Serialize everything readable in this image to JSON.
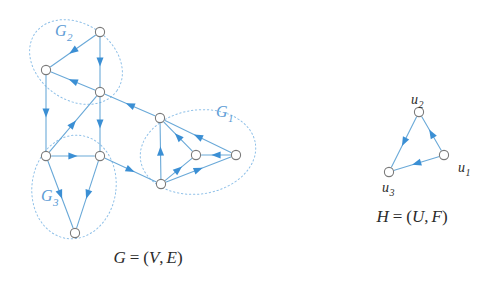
{
  "figure": {
    "background_color": "#ffffff",
    "edge_color": "#6aa9d8",
    "node_stroke_color": "#7a7a7a",
    "node_fill_color": "#ffffff",
    "cluster_outline_color": "#8fc0e8",
    "label_color_cluster": "#5b9bd5",
    "label_color_text": "#2b2b2b",
    "arrow_color": "#3b8fd4"
  },
  "graph_g": {
    "caption": "G = (V, E)",
    "caption_parts": {
      "name": "G",
      "equals": "=",
      "open": "(",
      "vertices": "V",
      "comma": ",",
      "edges": "E",
      "close": ")"
    },
    "clusters": [
      {
        "id": "G1",
        "label": "G",
        "subscript": "1",
        "label_x": 216,
        "label_y": 117,
        "cx": 198,
        "cy": 152,
        "rx": 58,
        "ry": 42,
        "rotation": -8
      },
      {
        "id": "G2",
        "label": "G",
        "subscript": "2",
        "label_x": 55,
        "label_y": 36,
        "cx": 76,
        "cy": 62,
        "rx": 50,
        "ry": 38,
        "rotation": 35
      },
      {
        "id": "G3",
        "label": "G",
        "subscript": "3",
        "label_x": 41,
        "label_y": 201,
        "cx": 74,
        "cy": 187,
        "rx": 42,
        "ry": 52,
        "rotation": 8
      }
    ],
    "nodes": [
      {
        "id": "v1",
        "x": 100,
        "y": 32,
        "cluster": "G2"
      },
      {
        "id": "v2",
        "x": 46,
        "y": 70,
        "cluster": "G2"
      },
      {
        "id": "v3",
        "x": 100,
        "y": 92,
        "cluster": "G2"
      },
      {
        "id": "v4",
        "x": 46,
        "y": 156,
        "cluster": "G3"
      },
      {
        "id": "v5",
        "x": 100,
        "y": 156,
        "cluster": "G3"
      },
      {
        "id": "v6",
        "x": 75,
        "y": 233,
        "cluster": "G3"
      },
      {
        "id": "v7",
        "x": 160,
        "y": 118,
        "cluster": "G1"
      },
      {
        "id": "v8",
        "x": 196,
        "y": 155,
        "cluster": "G1"
      },
      {
        "id": "v9",
        "x": 236,
        "y": 155,
        "cluster": "G1"
      },
      {
        "id": "v10",
        "x": 161,
        "y": 184,
        "cluster": "G1"
      }
    ],
    "edges": [
      {
        "from": "v1",
        "to": "v2"
      },
      {
        "from": "v1",
        "to": "v3"
      },
      {
        "from": "v2",
        "to": "v4"
      },
      {
        "from": "v3",
        "to": "v5"
      },
      {
        "from": "v3",
        "to": "v2"
      },
      {
        "from": "v4",
        "to": "v3"
      },
      {
        "from": "v4",
        "to": "v5"
      },
      {
        "from": "v4",
        "to": "v6"
      },
      {
        "from": "v5",
        "to": "v6"
      },
      {
        "from": "v5",
        "to": "v10"
      },
      {
        "from": "v7",
        "to": "v3"
      },
      {
        "from": "v10",
        "to": "v7"
      },
      {
        "from": "v8",
        "to": "v7"
      },
      {
        "from": "v9",
        "to": "v7"
      },
      {
        "from": "v9",
        "to": "v8"
      },
      {
        "from": "v10",
        "to": "v8"
      },
      {
        "from": "v10",
        "to": "v9"
      }
    ]
  },
  "graph_h": {
    "caption": "H = (U, F)",
    "caption_parts": {
      "name": "H",
      "equals": "=",
      "open": "(",
      "vertices": "U",
      "comma": ",",
      "edges": "F",
      "close": ")"
    },
    "nodes": [
      {
        "id": "u1",
        "label": "u",
        "subscript": "1",
        "x": 444,
        "y": 155,
        "label_x": 458,
        "label_y": 172
      },
      {
        "id": "u2",
        "label": "u",
        "subscript": "2",
        "x": 419,
        "y": 112,
        "label_x": 411,
        "label_y": 104
      },
      {
        "id": "u3",
        "label": "u",
        "subscript": "3",
        "x": 389,
        "y": 172,
        "label_x": 382,
        "label_y": 192
      }
    ],
    "edges": [
      {
        "from": "u1",
        "to": "u2"
      },
      {
        "from": "u2",
        "to": "u3"
      },
      {
        "from": "u1",
        "to": "u3"
      }
    ]
  }
}
